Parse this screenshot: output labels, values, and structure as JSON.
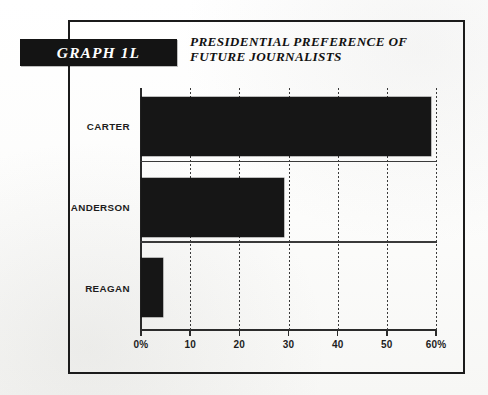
{
  "figure": {
    "graph_tag": "GRAPH 1L",
    "title_line_1": "PRESIDENTIAL PREFERENCE OF",
    "title_line_2": "FUTURE JOURNALISTS"
  },
  "colors": {
    "bar": "#161616",
    "tag_background": "#141414",
    "tag_text": "#ffffff",
    "frame": "#1b1b1b",
    "axis": "#2b2b2b",
    "grid": "#3a3a3a",
    "paper": "#fdfdfc"
  },
  "chart_data": {
    "type": "bar",
    "orientation": "horizontal",
    "title": "PRESIDENTIAL PREFERENCE OF FUTURE JOURNALISTS",
    "categories": [
      "CARTER",
      "ANDERSON",
      "REAGAN"
    ],
    "values": [
      59,
      29,
      4.5
    ],
    "xlabel": "",
    "ylabel": "",
    "xlim": [
      0,
      60
    ],
    "tick_values": [
      0,
      10,
      20,
      30,
      40,
      50,
      60
    ],
    "tick_labels": [
      "0%",
      "10",
      "20",
      "30",
      "40",
      "50",
      "60%"
    ],
    "grid": "vertical-dotted",
    "legend": "none",
    "units": "percent"
  }
}
